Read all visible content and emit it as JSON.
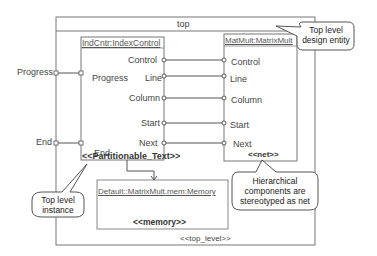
{
  "diagram": {
    "top": {
      "title": "top",
      "stereotype": "<<top_level>>"
    },
    "index_control": {
      "title": "IndCntr:IndexControl",
      "stereotype": "<<Partitionable_Text>>",
      "ports_left": [
        "Progress",
        "End"
      ],
      "ports_right": [
        "Control",
        "Line",
        "Column",
        "Start",
        "Next"
      ]
    },
    "matrix_mult": {
      "title": "MatMult:MatrixMult",
      "stereotype": "<<net>>",
      "ports": [
        "Control",
        "Line",
        "Column",
        "Start",
        "Next"
      ]
    },
    "memory": {
      "title": "Default::MatrixMult.mem:Memory",
      "stereotype": "<<memory>>"
    },
    "external_ports": [
      "Progress",
      "End"
    ],
    "callouts": {
      "top_level_entity": [
        "Top level",
        "design entity"
      ],
      "top_level_instance": [
        "Top level",
        "instance"
      ],
      "hierarchical": [
        "Hierarchical",
        "components are",
        "stereotyped as net"
      ]
    }
  }
}
